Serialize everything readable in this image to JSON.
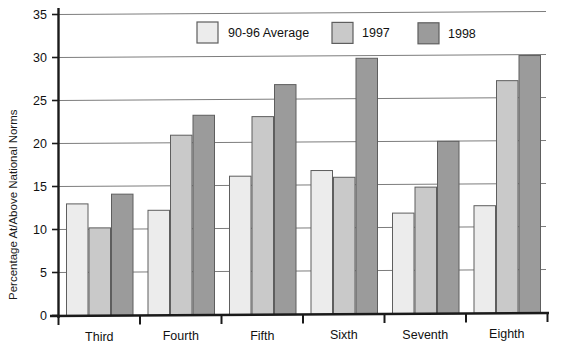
{
  "chart_data": {
    "type": "bar",
    "title": "",
    "xlabel": "",
    "ylabel": "Percentage At/Above National Norms",
    "categories": [
      "Third",
      "Fourth",
      "Fifth",
      "Sixth",
      "Seventh",
      "Eighth"
    ],
    "series": [
      {
        "name": "90-96 Average",
        "color": "#ececec",
        "values": [
          13.0,
          12.2,
          16.1,
          16.7,
          11.7,
          12.5
        ]
      },
      {
        "name": "1997",
        "color": "#c9c9c9",
        "values": [
          10.2,
          20.9,
          23.0,
          15.9,
          14.7,
          27.0
        ]
      },
      {
        "name": "1998",
        "color": "#9b9b9b",
        "values": [
          14.1,
          23.2,
          26.7,
          29.7,
          20.0,
          29.9
        ]
      }
    ],
    "ylim": [
      0,
      35
    ],
    "yticks": [
      0,
      5,
      10,
      15,
      20,
      25,
      30,
      35
    ],
    "ytick_labels": [
      "0",
      "5",
      "10",
      "15",
      "20",
      "25",
      "30",
      "35"
    ],
    "grid": true,
    "grid_axis": "y",
    "legend_position": "top-center"
  },
  "legend": {
    "items": [
      {
        "label": "90-96 Average",
        "color": "#ececec"
      },
      {
        "label": "1997",
        "color": "#c9c9c9"
      },
      {
        "label": "1998",
        "color": "#9b9b9b"
      }
    ]
  },
  "axes": {
    "y_title": "Percentage At/Above National Norms",
    "y_ticks": [
      "35",
      "30",
      "25",
      "20",
      "15",
      "10",
      "5",
      "0"
    ],
    "x_ticks": [
      "Third",
      "Fourth",
      "Fifth",
      "Sixth",
      "Seventh",
      "Eighth"
    ]
  }
}
